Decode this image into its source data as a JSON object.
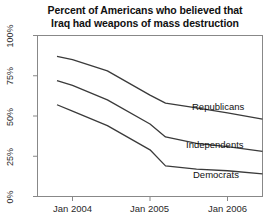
{
  "chart_data": {
    "type": "line",
    "title": "Percent of Americans who believed that Iraq had weapons of mass destruction",
    "title_line1": "Percent of Americans who believed that",
    "title_line2": "Iraq had weapons of mass destruction",
    "xlabel": "",
    "ylabel": "",
    "ylim": [
      0,
      100
    ],
    "xlim": [
      "Oct 2003",
      "Jul 2006"
    ],
    "grid": false,
    "legend_position": "inline-right",
    "ytick_labels": [
      "0%",
      "25%",
      "50%",
      "75%",
      "100%"
    ],
    "ytick_values": [
      0,
      25,
      50,
      75,
      100
    ],
    "xtick_labels": [
      "Jan 2004",
      "Jan 2005",
      "Jan 2006"
    ],
    "xtick_values": [
      2004.0,
      2005.0,
      2006.0
    ],
    "x": [
      2003.8,
      2004.0,
      2004.45,
      2005.0,
      2005.2,
      2005.6,
      2006.0,
      2006.55
    ],
    "series": [
      {
        "name": "Republicans",
        "values": [
          87,
          85,
          78,
          63,
          58,
          55,
          52,
          48
        ]
      },
      {
        "name": "Independents",
        "values": [
          72,
          69,
          60,
          45,
          37,
          33,
          31,
          28
        ]
      },
      {
        "name": "Democrats",
        "values": [
          57,
          53,
          44,
          29,
          19,
          17,
          16,
          14
        ]
      }
    ],
    "line_color": "#3a3a3a",
    "axis_color": "#808080"
  }
}
